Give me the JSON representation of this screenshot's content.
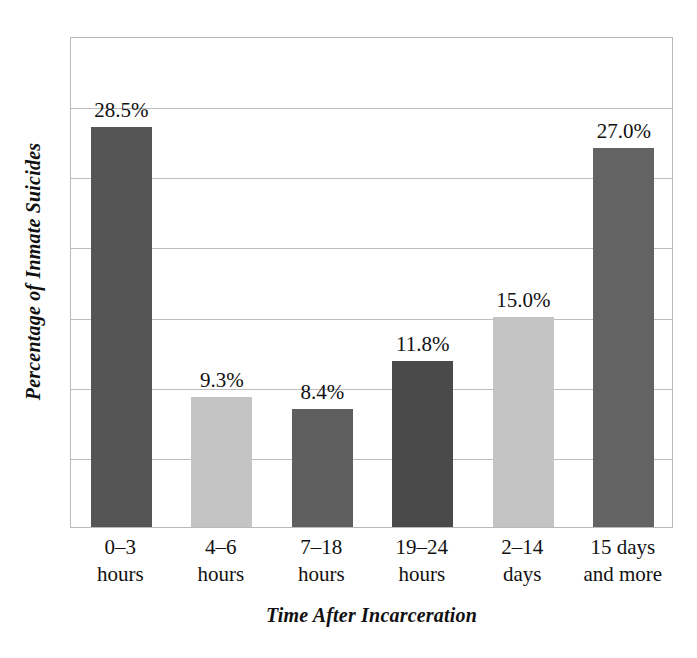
{
  "chart_data": {
    "type": "bar",
    "title": "",
    "xlabel": "Time After Incarceration",
    "ylabel": "Percentage of Inmate Suicides",
    "categories": [
      "0–3 hours",
      "4–6 hours",
      "7–18 hours",
      "19–24 hours",
      "2–14 days",
      "15 days and more"
    ],
    "category_lines": [
      [
        "0–3",
        "hours"
      ],
      [
        "4–6",
        "hours"
      ],
      [
        "7–18",
        "hours"
      ],
      [
        "19–24",
        "hours"
      ],
      [
        "2–14",
        "days"
      ],
      [
        "15 days",
        "and more"
      ]
    ],
    "values": [
      28.5,
      9.3,
      8.4,
      11.8,
      15.0,
      27.0
    ],
    "value_labels": [
      "28.5%",
      "9.3%",
      "8.4%",
      "11.8%",
      "15.0%",
      "27.0%"
    ],
    "bar_colors": [
      "#555555",
      "#c4c4c4",
      "#5f5f5f",
      "#4a4a4a",
      "#c4c4c4",
      "#636363"
    ],
    "ylim": [
      0,
      35
    ],
    "ytick_values": [
      0,
      5,
      10,
      15,
      20,
      25,
      30,
      35
    ],
    "ytick_labels": [],
    "grid": true,
    "grid_color": "#bdbdbd",
    "legend": false,
    "frame_color": "#b9b9b9",
    "background": "#ffffff"
  }
}
